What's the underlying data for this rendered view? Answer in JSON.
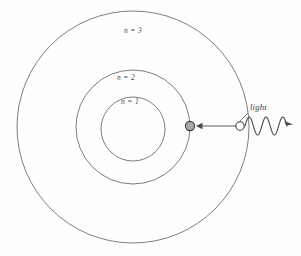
{
  "figure": {
    "background_color": "#fefefe",
    "width": 301,
    "height": 256
  },
  "orbits": [
    {
      "id": "n3",
      "label": "n = 3",
      "cx": 133,
      "cy": 127,
      "r": 116,
      "stroke": "#6e6e6e",
      "label_x": 133,
      "label_y": 33
    },
    {
      "id": "n2",
      "label": "n = 2",
      "cx": 133,
      "cy": 127,
      "r": 57,
      "stroke": "#6e6e6e",
      "label_x": 126,
      "label_y": 80
    },
    {
      "id": "n1",
      "label": "n = 1",
      "cx": 133,
      "cy": 129,
      "r": 32,
      "stroke": "#6e6e6e",
      "label_x": 130,
      "label_y": 104
    }
  ],
  "particles": [
    {
      "id": "electron-excited",
      "cx": 190,
      "cy": 126,
      "r": 4.6,
      "fill": "#a8a8a8",
      "stroke": "#3a3a3a"
    },
    {
      "id": "electron-ground",
      "cx": 240,
      "cy": 126,
      "r": 4.2,
      "fill": "#ffffff",
      "stroke": "#3a3a3a"
    }
  ],
  "arrow": {
    "id": "transition-arrow",
    "x_start": 236,
    "x_end": 196,
    "y": 126,
    "stroke": "#4a4a4a",
    "direction": "left"
  },
  "wave": {
    "id": "light-wave",
    "x_start": 245,
    "x_end": 287,
    "y": 126,
    "amplitude": 9,
    "cycles": 2.5,
    "stroke": "#4a4a4a",
    "arrow_direction": "right"
  },
  "light_label": {
    "text": "light",
    "x": 250,
    "y": 110,
    "leader_from_x": 248,
    "leader_from_y": 113,
    "leader_to_x": 240,
    "leader_to_y": 121
  },
  "colors": {
    "line": "#6e6e6e",
    "accent_line": "#4a4a4a",
    "text": "#4a4a4a",
    "electron_fill": "#a8a8a8",
    "photon_fill": "#ffffff",
    "background": "#fefefe"
  }
}
